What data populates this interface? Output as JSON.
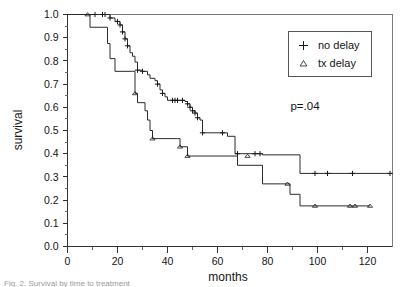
{
  "figure": {
    "caption_fragment": "Fig. 2.  Survival by time to treatment"
  },
  "axes": {
    "y_title": "survival",
    "x_title": "months",
    "y_ticks": [
      "0.0",
      "0.1",
      "0.2",
      "0.3",
      "0.4",
      "0.5",
      "0.6",
      "0.7",
      "0.8",
      "0.9",
      "1.0"
    ],
    "x_ticks": [
      "0",
      "20",
      "40",
      "60",
      "80",
      "100",
      "120"
    ]
  },
  "legend": {
    "entries": [
      {
        "marker": "plus-marker",
        "label": "no delay"
      },
      {
        "marker": "triangle-marker",
        "label": "tx delay"
      }
    ]
  },
  "annotations": {
    "p_value": "p=.04"
  },
  "colors": {
    "curve": "#2b2b2b",
    "axis": "#333333",
    "frame": "#7a7a7a",
    "text": "#141414",
    "background": "#ffffff"
  },
  "chart_data": {
    "type": "line",
    "title": "",
    "xlabel": "months",
    "ylabel": "survival",
    "xlim": [
      0,
      130
    ],
    "ylim": [
      0.0,
      1.0
    ],
    "grid": false,
    "legend_position": "top-right",
    "annotations": [
      {
        "text": "p=.04",
        "x": 97,
        "y": 0.55
      }
    ],
    "curve_style": "step-post",
    "series": [
      {
        "name": "no delay",
        "marker": "+",
        "points": [
          [
            0,
            1.0
          ],
          [
            9,
            1.0
          ],
          [
            17,
            0.985
          ],
          [
            19,
            0.97
          ],
          [
            21,
            0.955
          ],
          [
            22,
            0.925
          ],
          [
            23,
            0.895
          ],
          [
            24,
            0.865
          ],
          [
            25,
            0.835
          ],
          [
            26,
            0.82
          ],
          [
            27,
            0.795
          ],
          [
            28,
            0.76
          ],
          [
            30,
            0.755
          ],
          [
            32,
            0.74
          ],
          [
            33,
            0.725
          ],
          [
            35,
            0.715
          ],
          [
            36,
            0.7
          ],
          [
            37,
            0.675
          ],
          [
            38,
            0.66
          ],
          [
            39,
            0.645
          ],
          [
            40,
            0.63
          ],
          [
            45,
            0.63
          ],
          [
            47,
            0.625
          ],
          [
            48,
            0.615
          ],
          [
            49,
            0.6
          ],
          [
            50,
            0.585
          ],
          [
            51,
            0.575
          ],
          [
            52,
            0.555
          ],
          [
            53,
            0.545
          ],
          [
            54,
            0.49
          ],
          [
            62,
            0.49
          ],
          [
            64,
            0.475
          ],
          [
            67,
            0.4
          ],
          [
            77,
            0.4
          ],
          [
            78,
            0.395
          ],
          [
            93,
            0.315
          ],
          [
            130,
            0.315
          ]
        ],
        "censored": [
          [
            11,
            1.0
          ],
          [
            14,
            1.0
          ],
          [
            15,
            1.0
          ],
          [
            17,
            0.985
          ],
          [
            20,
            0.97
          ],
          [
            21,
            0.955
          ],
          [
            22,
            0.925
          ],
          [
            23,
            0.895
          ],
          [
            24,
            0.865
          ],
          [
            28,
            0.76
          ],
          [
            30,
            0.755
          ],
          [
            36,
            0.7
          ],
          [
            38,
            0.66
          ],
          [
            42,
            0.63
          ],
          [
            43,
            0.63
          ],
          [
            44,
            0.63
          ],
          [
            46,
            0.63
          ],
          [
            48,
            0.615
          ],
          [
            49,
            0.6
          ],
          [
            50,
            0.585
          ],
          [
            51,
            0.575
          ],
          [
            52,
            0.555
          ],
          [
            54,
            0.49
          ],
          [
            62,
            0.49
          ],
          [
            68,
            0.4
          ],
          [
            75,
            0.4
          ],
          [
            77,
            0.4
          ],
          [
            99,
            0.315
          ],
          [
            104,
            0.315
          ],
          [
            114,
            0.315
          ],
          [
            129,
            0.315
          ]
        ]
      },
      {
        "name": "tx delay",
        "marker": "triangle",
        "points": [
          [
            0,
            1.0
          ],
          [
            8,
            1.0
          ],
          [
            9,
            0.945
          ],
          [
            15,
            0.945
          ],
          [
            16,
            0.875
          ],
          [
            17,
            0.81
          ],
          [
            19,
            0.755
          ],
          [
            26,
            0.755
          ],
          [
            27,
            0.66
          ],
          [
            28,
            0.62
          ],
          [
            31,
            0.585
          ],
          [
            32,
            0.545
          ],
          [
            33,
            0.5
          ],
          [
            34,
            0.465
          ],
          [
            44,
            0.465
          ],
          [
            45,
            0.43
          ],
          [
            47,
            0.43
          ],
          [
            48,
            0.39
          ],
          [
            67,
            0.39
          ],
          [
            68,
            0.35
          ],
          [
            77,
            0.35
          ],
          [
            78,
            0.27
          ],
          [
            88,
            0.27
          ],
          [
            89,
            0.225
          ],
          [
            93,
            0.175
          ],
          [
            121,
            0.175
          ]
        ],
        "censored": [
          [
            8,
            1.0
          ],
          [
            27,
            0.66
          ],
          [
            34,
            0.465
          ],
          [
            45,
            0.43
          ],
          [
            48,
            0.39
          ],
          [
            72,
            0.39
          ],
          [
            88,
            0.27
          ],
          [
            99,
            0.175
          ],
          [
            113,
            0.175
          ],
          [
            115,
            0.175
          ],
          [
            121,
            0.175
          ]
        ]
      }
    ]
  }
}
